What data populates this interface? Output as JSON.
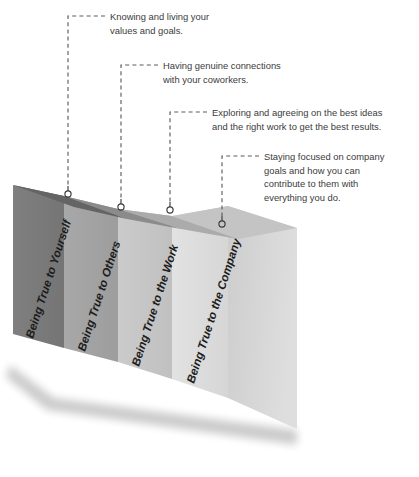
{
  "diagram": {
    "type": "stepped-isometric-block-diagram",
    "panels": [
      {
        "label": "Being True to Yourself",
        "face_color": "#7b7b7b",
        "top_color": "#616161",
        "marker": "circle-marker"
      },
      {
        "label": "Being True to Others",
        "face_color": "#a3a3a3",
        "top_color": "#8a8a8a",
        "marker": "circle-marker"
      },
      {
        "label": "Being True to the Work",
        "face_color": "#c6c6c6",
        "top_color": "#a9a9a9",
        "marker": "circle-marker"
      },
      {
        "label": "Being True to the Company",
        "face_color": "#dcdcdc",
        "top_color": "#c2c2c2",
        "marker": "circle-marker"
      }
    ],
    "callouts": [
      {
        "lines": [
          "Knowing and living your",
          "values and goals."
        ],
        "connector": "dashed-leader-line"
      },
      {
        "lines": [
          "Having genuine connections",
          "with your coworkers."
        ],
        "connector": "dashed-leader-line"
      },
      {
        "lines": [
          "Exploring and agreeing on the best ideas",
          "and the right work to get the best results."
        ],
        "connector": "dashed-leader-line"
      },
      {
        "lines": [
          "Staying focused on company",
          "goals and how you can",
          "contribute to them with",
          "everything you do."
        ],
        "connector": "dashed-leader-line"
      }
    ],
    "colors": {
      "text": "#3b3b3b",
      "label_text": "#1c1c1c",
      "leader_line": "#5d5d5d",
      "marker": "#3a3a3a",
      "background": "#ffffff",
      "end_face": "#cfcfcf"
    }
  }
}
